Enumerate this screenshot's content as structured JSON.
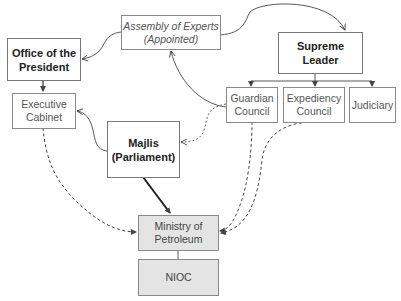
{
  "diagram": {
    "nodes": {
      "assembly_of_experts": {
        "label": "Assembly of Experts\n(Appointed)",
        "style": "italic"
      },
      "office_of_president": {
        "label": "Office of the\nPresident",
        "style": "bold"
      },
      "supreme_leader": {
        "label": "Supreme\nLeader",
        "style": "bold"
      },
      "guardian_council": {
        "label": "Guardian\nCouncil",
        "style": "normal"
      },
      "expediency_council": {
        "label": "Expediency\nCouncil",
        "style": "normal"
      },
      "judiciary": {
        "label": "Judiciary",
        "style": "normal"
      },
      "executive_cabinet": {
        "label": "Executive\nCabinet",
        "style": "normal"
      },
      "majlis": {
        "label": "Majlis\n(Parliament)",
        "style": "bold"
      },
      "ministry_of_petroleum": {
        "label": "Ministry of\nPetroleum",
        "style": "shaded"
      },
      "nioc": {
        "label": "NIOC",
        "style": "shaded"
      }
    },
    "edges": [
      {
        "from": "assembly_of_experts",
        "to": "supreme_leader",
        "type": "solid-thin-arrow"
      },
      {
        "from": "assembly_of_experts",
        "to": "office_of_president",
        "type": "solid-thin-arrow"
      },
      {
        "from": "supreme_leader",
        "to": "guardian_council",
        "type": "solid-arrow"
      },
      {
        "from": "supreme_leader",
        "to": "expediency_council",
        "type": "solid-arrow"
      },
      {
        "from": "supreme_leader",
        "to": "judiciary",
        "type": "solid-arrow"
      },
      {
        "from": "guardian_council",
        "to": "assembly_of_experts",
        "type": "solid-thin-arrow"
      },
      {
        "from": "guardian_council",
        "to": "majlis",
        "type": "dotted-arrow"
      },
      {
        "from": "office_of_president",
        "to": "executive_cabinet",
        "type": "solid-arrow"
      },
      {
        "from": "majlis",
        "to": "executive_cabinet",
        "type": "solid-thin-arrow"
      },
      {
        "from": "majlis",
        "to": "ministry_of_petroleum",
        "type": "thick-solid-arrow"
      },
      {
        "from": "executive_cabinet",
        "to": "ministry_of_petroleum",
        "type": "dashed-arrow"
      },
      {
        "from": "guardian_council",
        "to": "ministry_of_petroleum",
        "type": "dashed-arrow"
      },
      {
        "from": "expediency_council",
        "to": "ministry_of_petroleum",
        "type": "dashed-arrow"
      },
      {
        "from": "ministry_of_petroleum",
        "to": "nioc",
        "type": "solid-line"
      }
    ],
    "colors": {
      "line": "#444444",
      "border": "#8a8a8a",
      "shaded_fill": "#e4e4e4"
    }
  }
}
